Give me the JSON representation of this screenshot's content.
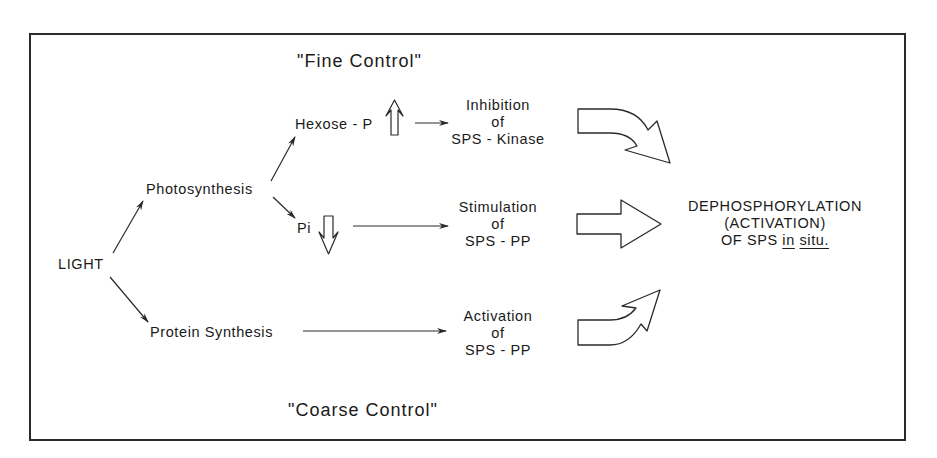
{
  "diagram": {
    "headings": {
      "fine_control": "\"Fine Control\"",
      "coarse_control": "\"Coarse Control\""
    },
    "nodes": {
      "light": "LIGHT",
      "photosynthesis": "Photosynthesis",
      "protein_synthesis": "Protein Synthesis",
      "hexose_p": "Hexose - P",
      "pi": "Pi"
    },
    "effects": {
      "inhibition": {
        "line1": "Inhibition",
        "line2": "of",
        "line3": "SPS - Kinase"
      },
      "stimulation": {
        "line1": "Stimulation",
        "line2": "of",
        "line3": "SPS - PP"
      },
      "activation": {
        "line1": "Activation",
        "line2": "of",
        "line3": "SPS - PP"
      }
    },
    "outcome": {
      "line1": "DEPHOSPHORYLATION",
      "line2": "(ACTIVATION)",
      "line3_prefix": "OF SPS",
      "line3_in": "in",
      "line3_situ": "situ."
    },
    "indicators": {
      "hexose_p_change": "up-arrow (increase)",
      "pi_change": "down-arrow (decrease)"
    },
    "colors": {
      "stroke": "#2a2a2a",
      "background": "#ffffff"
    }
  }
}
